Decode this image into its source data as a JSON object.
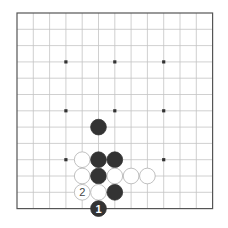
{
  "board": {
    "cols": 13,
    "rows": 13,
    "origin_x": 17,
    "origin_y": 13,
    "spacing": 16.3,
    "open_top": false,
    "open_right": false,
    "grid_color": "#c4c4c4",
    "border_color": "#555555",
    "star_color": "#333333",
    "star_points": [
      [
        3,
        3
      ],
      [
        6,
        3
      ],
      [
        9,
        3
      ],
      [
        3,
        6
      ],
      [
        6,
        6
      ],
      [
        9,
        6
      ],
      [
        3,
        9
      ],
      [
        9,
        9
      ]
    ]
  },
  "stones": [
    {
      "color": "black",
      "col": 5,
      "row": 7,
      "label": ""
    },
    {
      "color": "white",
      "col": 4,
      "row": 9,
      "label": ""
    },
    {
      "color": "black",
      "col": 5,
      "row": 9,
      "label": ""
    },
    {
      "color": "black",
      "col": 6,
      "row": 9,
      "label": ""
    },
    {
      "color": "white",
      "col": 4,
      "row": 10,
      "label": ""
    },
    {
      "color": "black",
      "col": 5,
      "row": 10,
      "label": ""
    },
    {
      "color": "white",
      "col": 6,
      "row": 10,
      "label": ""
    },
    {
      "color": "white",
      "col": 7,
      "row": 10,
      "label": ""
    },
    {
      "color": "white",
      "col": 8,
      "row": 10,
      "label": ""
    },
    {
      "color": "white",
      "col": 4,
      "row": 11,
      "label": "2"
    },
    {
      "color": "white",
      "col": 5,
      "row": 11,
      "label": ""
    },
    {
      "color": "black",
      "col": 6,
      "row": 11,
      "label": ""
    },
    {
      "color": "black",
      "col": 5,
      "row": 12,
      "label": "1"
    }
  ],
  "colors": {
    "black_stone": "#333333",
    "white_stone": "#ffffff",
    "white_stone_outline": "#b0b0b0",
    "black_label": "#ffffff",
    "white_label": "#444444"
  }
}
